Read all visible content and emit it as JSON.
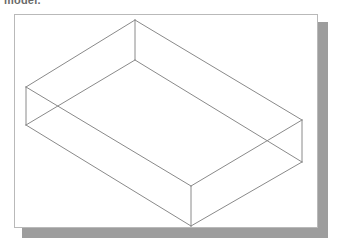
{
  "caption": {
    "text": "model.",
    "color": "#6a6a6a"
  },
  "sheet": {
    "name": "drawing-sheet",
    "background": "#ffffff",
    "border_color": "#b9b9b9",
    "shadow_color": "#9d9d9d"
  },
  "figure": {
    "type": "wireframe-isometric-box",
    "line_color": "#8a8a8a",
    "line_width": 1,
    "fill": "none",
    "vertices": {
      "top_back": [
        135,
        20
      ],
      "top_left": [
        26,
        87
      ],
      "top_right": [
        302,
        120
      ],
      "top_front": [
        191,
        186
      ],
      "bot_back": [
        135,
        60
      ],
      "bot_left": [
        26,
        125
      ],
      "bot_right": [
        302,
        162
      ],
      "bot_front": [
        191,
        226
      ]
    },
    "edges": [
      [
        "top_back",
        "top_left"
      ],
      [
        "top_back",
        "top_right"
      ],
      [
        "top_left",
        "top_front"
      ],
      [
        "top_right",
        "top_front"
      ],
      [
        "bot_back",
        "bot_left"
      ],
      [
        "bot_back",
        "bot_right"
      ],
      [
        "bot_left",
        "bot_front"
      ],
      [
        "bot_right",
        "bot_front"
      ],
      [
        "top_back",
        "bot_back"
      ],
      [
        "top_left",
        "bot_left"
      ],
      [
        "top_right",
        "bot_right"
      ],
      [
        "top_front",
        "bot_front"
      ]
    ]
  }
}
